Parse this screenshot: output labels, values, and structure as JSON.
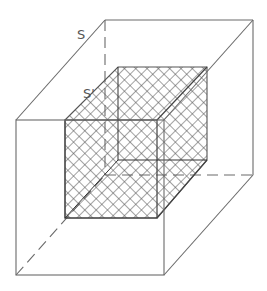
{
  "diagram": {
    "type": "nested-cubes",
    "labels": {
      "outer": "S",
      "inner": "S'"
    },
    "colors": {
      "line": "#6a6a6a",
      "hatch": "#555555",
      "background": "#ffffff"
    },
    "outer_cube": {
      "front_face": {
        "x": 16,
        "y": 120,
        "w": 148,
        "h": 155
      },
      "back_face": {
        "x": 105,
        "y": 20,
        "w": 148,
        "h": 155
      }
    },
    "inner_cube": {
      "front_face": {
        "x": 65,
        "y": 120,
        "w": 92,
        "h": 98
      },
      "back_face": {
        "x": 118,
        "y": 67,
        "w": 89,
        "h": 93
      },
      "fill": "cross-hatch"
    }
  }
}
